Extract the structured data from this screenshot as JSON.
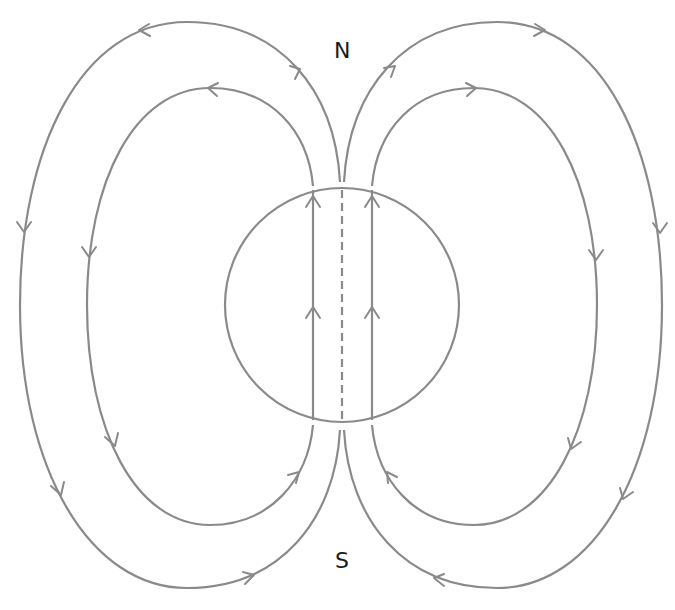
{
  "diagram": {
    "type": "magnetic-field-lines-sphere",
    "labels": {
      "north": "N",
      "south": "S"
    },
    "colors": {
      "line": "#8a8a8a",
      "label": "#1a1a1a",
      "background": "#ffffff"
    },
    "elements": {
      "circle": "magnetized sphere",
      "axis": "dashed vertical axis",
      "internal_field_lines": 2,
      "external_loops_left": 2,
      "external_loops_right": 2
    }
  }
}
